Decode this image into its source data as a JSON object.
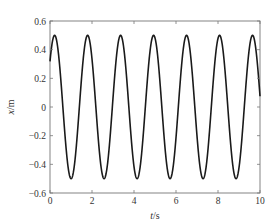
{
  "chart_data": {
    "type": "line",
    "title": "",
    "xlabel": "t/s",
    "xlabel_italic_part": "t",
    "xlabel_unit_part": "/s",
    "ylabel": "x/m",
    "ylabel_italic_part": "x",
    "ylabel_unit_part": "/m",
    "xlim": [
      0,
      10
    ],
    "ylim": [
      -0.6,
      0.6
    ],
    "xticks": [
      0,
      2,
      4,
      6,
      8,
      10
    ],
    "xtick_labels": [
      "0",
      "2",
      "4",
      "6",
      "8",
      "10"
    ],
    "yticks": [
      0.6,
      0.4,
      0.2,
      0,
      -0.2,
      -0.4,
      -0.6
    ],
    "ytick_labels": [
      "0.6",
      "0.4",
      "0.2",
      "0",
      "−0.2",
      "−0.4",
      "−0.6"
    ],
    "grid": false,
    "legend": null,
    "series": [
      {
        "name": "x(t)",
        "color": "#1a1a1a",
        "description": "sinusoid x = 0.5 sin(4t + 0.69)",
        "amplitude": 0.5,
        "angular_frequency": 4,
        "phase": 0.69,
        "period": 1.571,
        "x": [
          0,
          0.22,
          0.61,
          1.0,
          1.39,
          1.79,
          2.18,
          2.57,
          2.97,
          3.36,
          3.75,
          4.14,
          4.54,
          4.93,
          5.32,
          5.71,
          6.11,
          6.5,
          6.89,
          7.29,
          7.68,
          8.07,
          8.46,
          8.86,
          9.25,
          9.64,
          10
        ],
        "y": [
          0.32,
          0.5,
          0.0,
          -0.5,
          0.0,
          0.5,
          0.0,
          -0.5,
          0.0,
          0.5,
          0.0,
          -0.5,
          0.0,
          0.5,
          0.0,
          -0.5,
          0.0,
          0.5,
          0.0,
          -0.5,
          0.0,
          0.5,
          0.0,
          -0.5,
          0.0,
          0.5,
          0.07
        ]
      }
    ]
  },
  "colors": {
    "axis": "#777777",
    "line": "#1a1a1a",
    "text": "#333333"
  }
}
